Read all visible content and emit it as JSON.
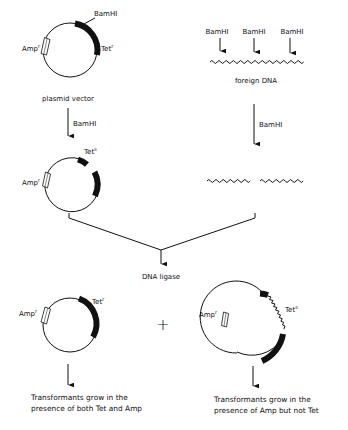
{
  "diagram": {
    "type": "cloning-scheme",
    "colors": {
      "ink": "#111111",
      "background": "#ffffff"
    },
    "plasmid_vector": {
      "label": "plasmid vector",
      "amp_label": "Amp",
      "amp_sup": "r",
      "tet_label": "Tet",
      "tet_sup": "r",
      "site_label": "BamHI"
    },
    "vector_digest": {
      "enzyme_label": "BamHI",
      "amp_label": "Amp",
      "amp_sup": "r",
      "tet_label": "Tet",
      "tet_sup": "s"
    },
    "foreign_dna": {
      "label": "foreign DNA",
      "site_labels": [
        "BamHI",
        "BamHI",
        "BamHI"
      ]
    },
    "foreign_digest": {
      "enzyme_label": "BamHI"
    },
    "ligation": {
      "label": "DNA ligase"
    },
    "products": {
      "plus_sign": "+",
      "left": {
        "amp_label": "Amp",
        "amp_sup": "r",
        "tet_label": "Tet",
        "tet_sup": "r",
        "result_line1": "Transformants grow in the",
        "result_line2": "presence of both Tet and Amp"
      },
      "right": {
        "amp_label": "Amp",
        "amp_sup": "r",
        "tet_label": "Tet",
        "tet_sup": "s",
        "result_line1": "Transformants grow in the",
        "result_line2": "presence of Amp but not Tet"
      }
    }
  }
}
